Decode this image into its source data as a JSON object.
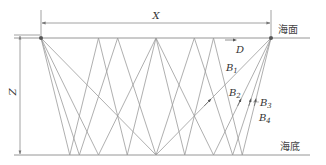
{
  "diagram": {
    "title_labels": {
      "horizontal_distance": "X",
      "depth": "Z",
      "sea_surface": "海面",
      "sea_bottom": "海底"
    },
    "rays": [
      {
        "id": "D",
        "label": "D",
        "subscript": "",
        "bottom_bounces": 0
      },
      {
        "id": "B1",
        "label": "B",
        "subscript": "1",
        "bottom_bounces": 1
      },
      {
        "id": "B2",
        "label": "B",
        "subscript": "2",
        "bottom_bounces": 2
      },
      {
        "id": "B3",
        "label": "B",
        "subscript": "3",
        "bottom_bounces": 3
      },
      {
        "id": "B4",
        "label": "B",
        "subscript": "4",
        "bottom_bounces": 4
      }
    ],
    "colors": {
      "line": "#8a8a8a",
      "ray": "#9a9a9a",
      "point": "#555555",
      "text": "#333333"
    },
    "geometry": {
      "source": [
        41,
        38
      ],
      "receiver": [
        271,
        38
      ],
      "surface_y": 38,
      "bottom_y": 155
    }
  }
}
